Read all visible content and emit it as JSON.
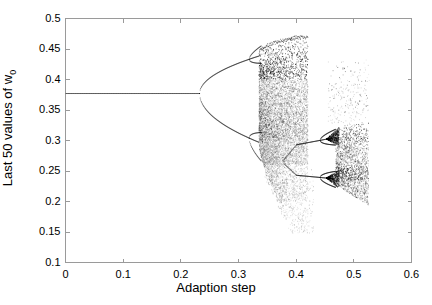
{
  "chart_data": {
    "type": "scatter",
    "title": "",
    "xlabel": "Adaption step",
    "ylabel": "Last 50 values of w_0",
    "ylabel_text": "Last 50 values of w",
    "ylabel_sub": "0",
    "xlim": [
      0,
      0.6
    ],
    "ylim": [
      0.1,
      0.5
    ],
    "xticks": [
      "0",
      "0.1",
      "0.2",
      "0.3",
      "0.4",
      "0.5",
      "0.6"
    ],
    "xtick_values": [
      0,
      0.1,
      0.2,
      0.3,
      0.4,
      0.5,
      0.6
    ],
    "yticks": [
      "0.1",
      "0.15",
      "0.2",
      "0.25",
      "0.3",
      "0.35",
      "0.4",
      "0.45",
      "0.5"
    ],
    "ytick_values": [
      0.1,
      0.15,
      0.2,
      0.25,
      0.3,
      0.35,
      0.4,
      0.45,
      0.5
    ],
    "grid": false,
    "legend": null,
    "point_color": "#000000",
    "axis_color": "#9a9a9a",
    "background": "#ffffff",
    "regions": {
      "fixed_point_value": 0.377,
      "fixed_point_x_range": [
        0.0,
        0.232
      ],
      "first_bifurcation_x": 0.232,
      "second_bifurcation_x": 0.318,
      "chaos_onset_x": 0.335,
      "chaos_x_range": [
        0.335,
        0.4
      ],
      "chaos_y_range": [
        0.15,
        0.472
      ],
      "periodic_window_x_range": [
        0.4,
        0.468
      ],
      "periodic_window_branches": [
        0.293,
        0.243
      ],
      "window_bifurcation_x": 0.441,
      "secondary_chaos_x_range": [
        0.468,
        0.525
      ],
      "secondary_chaos_y_range": [
        0.195,
        0.325
      ],
      "data_end_x": 0.527,
      "sparse_upper_tail_x_range": [
        0.455,
        0.527
      ],
      "sparse_upper_tail_y_range": [
        0.33,
        0.44
      ]
    },
    "branches": [
      {
        "name": "fixed-point",
        "x_start": 0.0,
        "x_end": 0.232,
        "y_start": 0.377,
        "y_end": 0.377
      },
      {
        "name": "upper-branch-period2",
        "x_start": 0.232,
        "x_end": 0.335,
        "y_start": 0.377,
        "y_end": 0.437
      },
      {
        "name": "lower-branch-period2",
        "x_start": 0.232,
        "x_end": 0.335,
        "y_start": 0.377,
        "y_end": 0.3
      },
      {
        "name": "window-upper",
        "x_start": 0.4,
        "x_end": 0.441,
        "y_start": 0.289,
        "y_end": 0.296
      },
      {
        "name": "window-lower",
        "x_start": 0.4,
        "x_end": 0.441,
        "y_start": 0.246,
        "y_end": 0.241
      }
    ]
  },
  "axes": {
    "xlabel": "Adaption step",
    "ylabel_text": "Last 50 values of w",
    "ylabel_sub": "0"
  }
}
